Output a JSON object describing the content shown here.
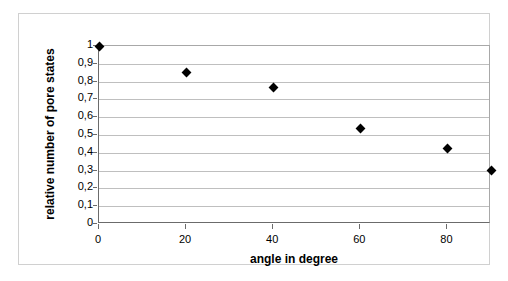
{
  "chart_data": {
    "type": "scatter",
    "title": "",
    "xlabel": "angle in degree",
    "ylabel": "relative number of pore states",
    "xlim": [
      0,
      90
    ],
    "ylim": [
      0,
      1
    ],
    "grid": true,
    "legend": false,
    "marker": "diamond",
    "marker_color": "#000000",
    "x": [
      0,
      20,
      40,
      60,
      80,
      90
    ],
    "values": [
      1.0,
      0.85,
      0.765,
      0.535,
      0.425,
      0.3
    ],
    "xticks": [
      {
        "value": 0,
        "label": "0"
      },
      {
        "value": 20,
        "label": "20"
      },
      {
        "value": 40,
        "label": "40"
      },
      {
        "value": 60,
        "label": "60"
      },
      {
        "value": 80,
        "label": "80"
      }
    ],
    "yticks": [
      {
        "value": 1.0,
        "label": "1"
      },
      {
        "value": 0.9,
        "label": "0,9"
      },
      {
        "value": 0.8,
        "label": "0,8"
      },
      {
        "value": 0.7,
        "label": "0,7"
      },
      {
        "value": 0.6,
        "label": "0,6"
      },
      {
        "value": 0.5,
        "label": "0,5"
      },
      {
        "value": 0.4,
        "label": "0,4"
      },
      {
        "value": 0.3,
        "label": "0,3"
      },
      {
        "value": 0.2,
        "label": "0,2"
      },
      {
        "value": 0.1,
        "label": "0,1"
      },
      {
        "value": 0.0,
        "label": "0"
      }
    ],
    "colors": {
      "plot_background": "#ffffff",
      "gridline": "#bfbfbf",
      "axis": "#6b6b6b",
      "frame": "#d0d0d0",
      "text": "#000000"
    }
  }
}
